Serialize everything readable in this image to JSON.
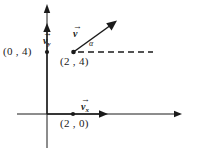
{
  "figure": {
    "type": "vector-decomposition-diagram",
    "stroke_color": "#1a1a1a",
    "background_color": "#ffffff"
  },
  "axes": {
    "x_axis_name": "x-axis",
    "y_axis_name": "y-axis",
    "origin_x_px": 47,
    "origin_y_px": 114,
    "x_axis_start_px": 17,
    "x_axis_end_px": 182,
    "y_axis_top_px": 5,
    "y_axis_bottom_px": 148
  },
  "labels": {
    "point_0_4": "(0 , 4)",
    "point_2_0": "(2 , 0)",
    "point_2_4": "(2 , 4)",
    "vector_main": "v",
    "vector_x": "v",
    "vector_x_sub": "x",
    "vector_y": "v",
    "vector_y_sub": "y",
    "angle": "α",
    "vector_arrow_bar": "→"
  },
  "geometry": {
    "vector_main_start": [
      73,
      52
    ],
    "vector_main_end": [
      116,
      21
    ],
    "vector_x_start": [
      47,
      114
    ],
    "vector_x_end": [
      107,
      114
    ],
    "vector_y_start": [
      47,
      114
    ],
    "vector_y_end": [
      47,
      25
    ],
    "dashed_line_start": [
      75,
      52
    ],
    "dashed_line_end": [
      153,
      52
    ],
    "dot_0_4": [
      47,
      52
    ],
    "dot_2_0": [
      73,
      114
    ],
    "dot_2_4": [
      73,
      52
    ]
  }
}
